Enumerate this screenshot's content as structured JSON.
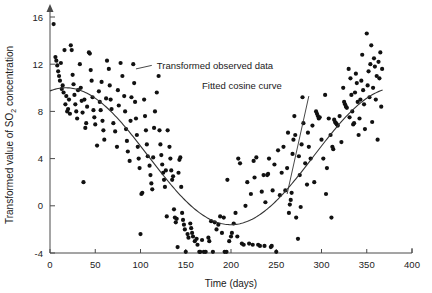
{
  "chart_data": {
    "type": "scatter",
    "title": "",
    "xlabel": "Time (days)",
    "ylabel_parts": {
      "before": "Transformed value of SO",
      "sub": "2",
      "after": " concentration"
    },
    "ylabel": "Transformed value of SO2 concentration",
    "xlim": [
      0,
      400
    ],
    "ylim": [
      -4,
      16
    ],
    "xticks": [
      0,
      50,
      100,
      150,
      200,
      250,
      300,
      350,
      400
    ],
    "xtick_labels": [
      "0",
      "50",
      "100",
      "150",
      "200",
      "250",
      "300",
      "350",
      "400"
    ],
    "yticks": [
      -4,
      0,
      4,
      8,
      12,
      16
    ],
    "ytick_labels": [
      "-4",
      "0",
      "4",
      "8",
      "12",
      "16"
    ],
    "grid": false,
    "legend_position": "inline-annotations",
    "annotations": [
      {
        "name": "observed-data-annotation",
        "text": "Transformed observed data",
        "x": 118,
        "y": 11.9
      },
      {
        "name": "fitted-curve-annotation",
        "text": "Fitted cosine curve",
        "x": 168,
        "y": 10.2
      }
    ],
    "series": [
      {
        "name": "Transformed observed data",
        "type": "scatter",
        "marker": "filled-circle",
        "color": "#111111",
        "points": [
          [
            4,
            15.4
          ],
          [
            6,
            12.6
          ],
          [
            7,
            12.3
          ],
          [
            8,
            11.9
          ],
          [
            9,
            11.4
          ],
          [
            10,
            11.0
          ],
          [
            11,
            10.6
          ],
          [
            12,
            12.1
          ],
          [
            13,
            9.9
          ],
          [
            14,
            10.2
          ],
          [
            15,
            9.6
          ],
          [
            16,
            13.2
          ],
          [
            17,
            8.6
          ],
          [
            18,
            9.3
          ],
          [
            19,
            8.0
          ],
          [
            20,
            8.2
          ],
          [
            21,
            9.0
          ],
          [
            22,
            7.8
          ],
          [
            23,
            13.6
          ],
          [
            24,
            13.2
          ],
          [
            25,
            11.1
          ],
          [
            26,
            10.3
          ],
          [
            27,
            9.4
          ],
          [
            28,
            8.6
          ],
          [
            29,
            8.0
          ],
          [
            30,
            7.4
          ],
          [
            31,
            9.8
          ],
          [
            33,
            12.0
          ],
          [
            34,
            10.0
          ],
          [
            35,
            8.9
          ],
          [
            36,
            7.9
          ],
          [
            37,
            2.0
          ],
          [
            38,
            9.0
          ],
          [
            39,
            6.6
          ],
          [
            40,
            7.0
          ],
          [
            41,
            8.4
          ],
          [
            43,
            13.0
          ],
          [
            44,
            12.9
          ],
          [
            45,
            11.5
          ],
          [
            46,
            10.6
          ],
          [
            47,
            9.2
          ],
          [
            48,
            8.1
          ],
          [
            49,
            7.5
          ],
          [
            50,
            6.9
          ],
          [
            52,
            5.1
          ],
          [
            54,
            9.7
          ],
          [
            55,
            8.8
          ],
          [
            56,
            8.1
          ],
          [
            57,
            10.5
          ],
          [
            58,
            7.2
          ],
          [
            59,
            6.4
          ],
          [
            60,
            5.6
          ],
          [
            62,
            9.1
          ],
          [
            63,
            12.3
          ],
          [
            65,
            11.6
          ],
          [
            66,
            10.2
          ],
          [
            67,
            9.0
          ],
          [
            68,
            8.2
          ],
          [
            70,
            7.0
          ],
          [
            72,
            6.3
          ],
          [
            74,
            5.0
          ],
          [
            75,
            9.8
          ],
          [
            76,
            8.5
          ],
          [
            78,
            12.1
          ],
          [
            80,
            11.0
          ],
          [
            82,
            9.3
          ],
          [
            83,
            8.0
          ],
          [
            84,
            6.5
          ],
          [
            85,
            5.5
          ],
          [
            86,
            4.6
          ],
          [
            88,
            3.8
          ],
          [
            89,
            7.2
          ],
          [
            90,
            9.2
          ],
          [
            92,
            12.0
          ],
          [
            93,
            10.4
          ],
          [
            94,
            8.8
          ],
          [
            95,
            7.4
          ],
          [
            96,
            6.0
          ],
          [
            97,
            5.0
          ],
          [
            98,
            4.0
          ],
          [
            99,
            3.2
          ],
          [
            100,
            -2.4
          ],
          [
            101,
            1.0
          ],
          [
            102,
            1.1
          ],
          [
            104,
            9.0
          ],
          [
            105,
            7.6
          ],
          [
            106,
            6.4
          ],
          [
            107,
            5.2
          ],
          [
            108,
            4.2
          ],
          [
            110,
            3.4
          ],
          [
            111,
            2.6
          ],
          [
            112,
            1.9
          ],
          [
            113,
            1.4
          ],
          [
            114,
            4.1
          ],
          [
            115,
            6.6
          ],
          [
            116,
            8.0
          ],
          [
            118,
            9.6
          ],
          [
            120,
            11.0
          ],
          [
            121,
            6.4
          ],
          [
            122,
            5.2
          ],
          [
            123,
            4.3
          ],
          [
            124,
            3.5
          ],
          [
            125,
            2.8
          ],
          [
            126,
            2.2
          ],
          [
            127,
            1.6
          ],
          [
            128,
            3.0
          ],
          [
            129,
            -0.9
          ],
          [
            130,
            6.4
          ],
          [
            132,
            5.0
          ],
          [
            133,
            4.0
          ],
          [
            134,
            3.0
          ],
          [
            135,
            2.2
          ],
          [
            136,
            2.5
          ],
          [
            137,
            -0.3
          ],
          [
            138,
            -1.0
          ],
          [
            139,
            -1.4
          ],
          [
            140,
            -1.1
          ],
          [
            141,
            -3.5
          ],
          [
            142,
            2.8
          ],
          [
            143,
            3.9
          ],
          [
            144,
            4.1
          ],
          [
            145,
            1.6
          ],
          [
            146,
            -0.6
          ],
          [
            147,
            -1.2
          ],
          [
            148,
            -1.6
          ],
          [
            149,
            -2.0
          ],
          [
            150,
            -3.9
          ],
          [
            152,
            -2.4
          ],
          [
            153,
            -2.7
          ],
          [
            155,
            -1.5
          ],
          [
            156,
            -1.9
          ],
          [
            157,
            -2.3
          ],
          [
            158,
            -2.6
          ],
          [
            160,
            -3.0
          ],
          [
            162,
            -2.8
          ],
          [
            163,
            -3.3
          ],
          [
            165,
            -3.9
          ],
          [
            166,
            -3.9
          ],
          [
            168,
            -2.9
          ],
          [
            170,
            -3.9
          ],
          [
            172,
            -3.9
          ],
          [
            175,
            -2.7
          ],
          [
            176,
            -3.0
          ],
          [
            178,
            -1.3
          ],
          [
            180,
            -3.9
          ],
          [
            182,
            -1.4
          ],
          [
            184,
            -2.0
          ],
          [
            186,
            -1.6
          ],
          [
            188,
            -0.9
          ],
          [
            190,
            -2.3
          ],
          [
            192,
            -1.0
          ],
          [
            193,
            -3.9
          ],
          [
            195,
            -3.9
          ],
          [
            196,
            2.2
          ],
          [
            198,
            -3.0
          ],
          [
            200,
            -2.6
          ],
          [
            201,
            -2.3
          ],
          [
            203,
            -1.5
          ],
          [
            205,
            -0.6
          ],
          [
            207,
            -2.6
          ],
          [
            208,
            4.0
          ],
          [
            210,
            3.6
          ],
          [
            212,
            -3.2
          ],
          [
            214,
            -3.3
          ],
          [
            216,
            0.0
          ],
          [
            218,
            2.0
          ],
          [
            220,
            -3.2
          ],
          [
            222,
            1.0
          ],
          [
            224,
            -3.3
          ],
          [
            225,
            3.8
          ],
          [
            226,
            2.4
          ],
          [
            228,
            4.1
          ],
          [
            230,
            -3.3
          ],
          [
            232,
            -3.4
          ],
          [
            234,
            1.2
          ],
          [
            236,
            2.6
          ],
          [
            237,
            -3.4
          ],
          [
            238,
            0.3
          ],
          [
            240,
            2.6
          ],
          [
            241,
            2.7
          ],
          [
            242,
            4.0
          ],
          [
            244,
            -3.5
          ],
          [
            245,
            -3.4
          ],
          [
            246,
            1.3
          ],
          [
            248,
            3.5
          ],
          [
            250,
            -3.9
          ],
          [
            252,
            4.7
          ],
          [
            254,
            0.9
          ],
          [
            256,
            2.8
          ],
          [
            258,
            5.0
          ],
          [
            260,
            1.3
          ],
          [
            262,
            3.2
          ],
          [
            263,
            6.2
          ],
          [
            264,
            -0.6
          ],
          [
            265,
            0.1
          ],
          [
            266,
            0.5
          ],
          [
            267,
            1.1
          ],
          [
            268,
            4.4
          ],
          [
            269,
            5.6
          ],
          [
            270,
            7.6
          ],
          [
            271,
            6.0
          ],
          [
            272,
            -1.0
          ],
          [
            274,
            -2.8
          ],
          [
            275,
            4.2
          ],
          [
            276,
            2.6
          ],
          [
            277,
            -0.1
          ],
          [
            278,
            5.2
          ],
          [
            279,
            9.2
          ],
          [
            280,
            7.0
          ],
          [
            282,
            3.6
          ],
          [
            284,
            1.8
          ],
          [
            285,
            6.2
          ],
          [
            286,
            5.0
          ],
          [
            288,
            4.0
          ],
          [
            290,
            6.8
          ],
          [
            292,
            2.0
          ],
          [
            294,
            8.0
          ],
          [
            295,
            7.8
          ],
          [
            296,
            7.6
          ],
          [
            297,
            7.4
          ],
          [
            298,
            7.5
          ],
          [
            300,
            5.6
          ],
          [
            302,
            4.0
          ],
          [
            304,
            9.4
          ],
          [
            305,
            1.0
          ],
          [
            306,
            3.2
          ],
          [
            308,
            7.4
          ],
          [
            310,
            6.0
          ],
          [
            311,
            -1.0
          ],
          [
            312,
            5.0
          ],
          [
            313,
            4.8
          ],
          [
            314,
            7.3
          ],
          [
            315,
            7.1
          ],
          [
            316,
            7.0
          ],
          [
            317,
            6.9
          ],
          [
            318,
            6.8
          ],
          [
            320,
            7.6
          ],
          [
            322,
            5.4
          ],
          [
            324,
            10.0
          ],
          [
            325,
            8.8
          ],
          [
            326,
            8.6
          ],
          [
            327,
            8.4
          ],
          [
            328,
            8.3
          ],
          [
            330,
            11.6
          ],
          [
            331,
            7.5
          ],
          [
            332,
            10.8
          ],
          [
            333,
            9.4
          ],
          [
            334,
            8.0
          ],
          [
            335,
            6.9
          ],
          [
            336,
            7.0
          ],
          [
            337,
            9.6
          ],
          [
            338,
            11.2
          ],
          [
            339,
            10.4
          ],
          [
            340,
            8.8
          ],
          [
            341,
            6.0
          ],
          [
            342,
            7.4
          ],
          [
            343,
            9.0
          ],
          [
            344,
            10.6
          ],
          [
            345,
            12.8
          ],
          [
            346,
            9.8
          ],
          [
            347,
            8.6
          ],
          [
            348,
            6.5
          ],
          [
            350,
            14.6
          ],
          [
            351,
            10.2
          ],
          [
            352,
            11.4
          ],
          [
            353,
            9.2
          ],
          [
            354,
            12.0
          ],
          [
            355,
            13.6
          ],
          [
            356,
            7.1
          ],
          [
            357,
            10.0
          ],
          [
            358,
            12.5
          ],
          [
            359,
            11.8
          ],
          [
            360,
            9.0
          ],
          [
            361,
            11.0
          ],
          [
            362,
            5.6
          ],
          [
            363,
            12.2
          ],
          [
            364,
            10.8
          ],
          [
            365,
            13.0
          ],
          [
            366,
            8.4
          ],
          [
            367,
            11.6
          ]
        ]
      },
      {
        "name": "Fitted cosine curve",
        "type": "line",
        "color": "#333333",
        "model": "cosine",
        "mean": 4.2,
        "amplitude": 5.8,
        "period_days": 365,
        "phase_min_day": 200,
        "x_start": 0,
        "x_end": 368
      }
    ]
  }
}
